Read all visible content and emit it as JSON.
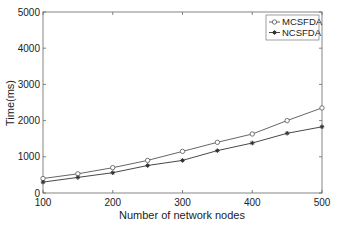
{
  "chart_data": {
    "type": "line",
    "title": "",
    "xlabel": "Number of network nodes",
    "ylabel": "Time(ms)",
    "x": [
      100,
      150,
      200,
      250,
      300,
      350,
      400,
      450,
      500
    ],
    "xlim": [
      100,
      500
    ],
    "ylim": [
      0,
      5000
    ],
    "xticks": [
      100,
      200,
      300,
      400,
      500
    ],
    "yticks": [
      0,
      1000,
      2000,
      3000,
      4000,
      5000
    ],
    "grid": false,
    "legend_position": "upper right",
    "series": [
      {
        "name": "MCSFDA",
        "marker": "open-circle",
        "color": "#555555",
        "values": [
          400,
          530,
          700,
          900,
          1150,
          1400,
          1630,
          2000,
          2350
        ]
      },
      {
        "name": "NCSFDA",
        "marker": "asterisk",
        "color": "#333333",
        "values": [
          300,
          430,
          560,
          760,
          900,
          1170,
          1380,
          1650,
          1830
        ]
      }
    ]
  }
}
